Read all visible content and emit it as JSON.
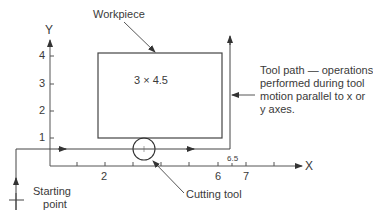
{
  "diagram": {
    "axes": {
      "x_label": "X",
      "y_label": "Y",
      "x_ticks": [
        {
          "value": 2,
          "label": "2"
        },
        {
          "value": 6,
          "label": "6"
        },
        {
          "value": 6.5,
          "label": "6.5"
        },
        {
          "value": 7,
          "label": "7"
        }
      ],
      "y_ticks": [
        {
          "value": 1,
          "label": "1"
        },
        {
          "value": 2,
          "label": "2"
        },
        {
          "value": 3,
          "label": "3"
        },
        {
          "value": 4,
          "label": "4"
        }
      ]
    },
    "workpiece": {
      "label": "Workpiece",
      "dimensions": "3 × 4.5"
    },
    "tool_path_note": {
      "line1": "Tool path — operations",
      "line2": "performed during tool",
      "line3": "motion parallel to x or",
      "line4": "y axes."
    },
    "cutting_tool": {
      "label": "Cutting tool"
    },
    "starting_point": {
      "line1": "Starting",
      "line2": "point"
    },
    "colors": {
      "line": "#444444",
      "text": "#3a3a3a",
      "background": "#ffffff"
    }
  }
}
